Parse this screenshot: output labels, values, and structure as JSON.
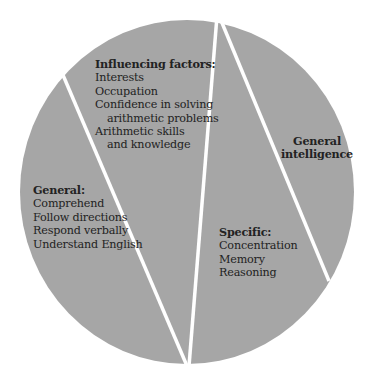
{
  "colors": {
    "segment_fill": "#a6a6a6",
    "divider": "#ffffff",
    "text": "#222222",
    "background": "#ffffff"
  },
  "segments": [
    {
      "id": "general",
      "heading": "General:",
      "items": [
        "Comprehend",
        "Follow directions",
        "Respond verbally",
        "Understand English"
      ]
    },
    {
      "id": "influencing-factors",
      "heading": "Influencing factors:",
      "items": [
        "Interests",
        "Occupation",
        "Confidence in solving",
        "arithmetic problems",
        "Arithmetic skills",
        "and knowledge"
      ]
    },
    {
      "id": "specific",
      "heading": "Specific:",
      "items": [
        "Concentration",
        "Memory",
        "Reasoning"
      ]
    },
    {
      "id": "general-intelligence",
      "heading_line1": "General",
      "heading_line2": "intelligence"
    }
  ]
}
